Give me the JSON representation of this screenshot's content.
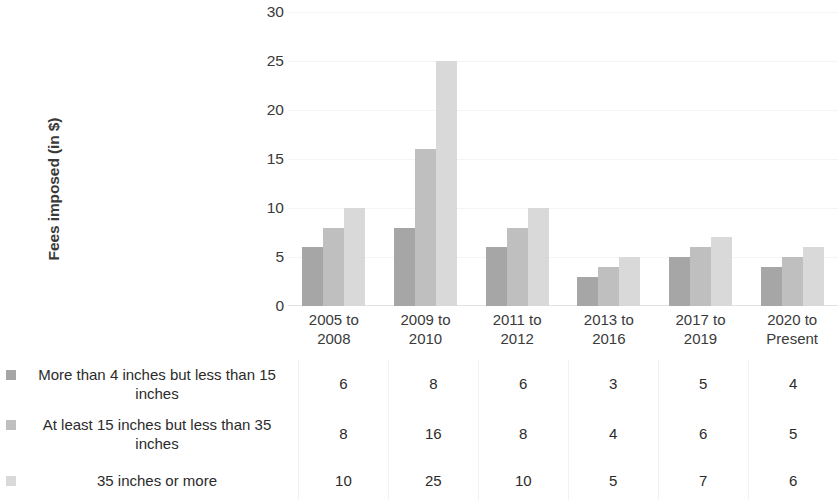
{
  "chart_data": {
    "type": "bar",
    "title": "",
    "subtitle": "",
    "xlabel": "",
    "ylabel": "Fees imposed (in $)",
    "ylim": [
      0,
      30
    ],
    "yticks": [
      0,
      5,
      10,
      15,
      20,
      25,
      30
    ],
    "grid": false,
    "legend_position": "bottom-table",
    "categories": [
      "2005 to 2008",
      "2009 to 2010",
      "2011 to 2012",
      "2013 to 2016",
      "2017 to 2019",
      "2020 to Present"
    ],
    "category_lines": [
      [
        "2005 to",
        "2008"
      ],
      [
        "2009 to",
        "2010"
      ],
      [
        "2011 to",
        "2012"
      ],
      [
        "2013 to",
        "2016"
      ],
      [
        "2017 to",
        "2019"
      ],
      [
        "2020 to",
        "Present"
      ]
    ],
    "series": [
      {
        "name": "More than 4 inches but less than 15 inches",
        "color": "#a6a6a6",
        "values": [
          6,
          8,
          6,
          3,
          5,
          4
        ]
      },
      {
        "name": "At least 15 inches but less than 35 inches",
        "color": "#bfbfbf",
        "values": [
          8,
          16,
          8,
          4,
          6,
          5
        ]
      },
      {
        "name": "35 inches or more",
        "color": "#d9d9d9",
        "values": [
          10,
          25,
          10,
          5,
          7,
          6
        ]
      }
    ]
  },
  "axis": {
    "y_title": "Fees imposed (in $)",
    "y_tick_labels": [
      "30",
      "25",
      "20",
      "15",
      "10",
      "5",
      "0"
    ]
  },
  "table": {
    "rows": [
      {
        "label": "More than 4 inches but less than 15 inches",
        "swatch": "#a6a6a6",
        "values": [
          "6",
          "8",
          "6",
          "3",
          "5",
          "4"
        ]
      },
      {
        "label": "At least 15 inches but less than 35 inches",
        "swatch": "#bfbfbf",
        "values": [
          "8",
          "16",
          "8",
          "4",
          "6",
          "5"
        ]
      },
      {
        "label": "35 inches or more",
        "swatch": "#d9d9d9",
        "values": [
          "10",
          "25",
          "10",
          "5",
          "7",
          "6"
        ]
      }
    ]
  }
}
